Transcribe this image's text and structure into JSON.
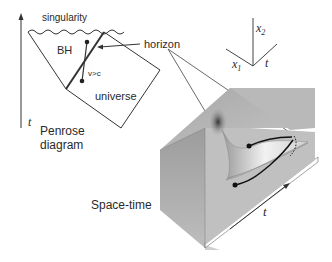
{
  "penrose": {
    "singularity": "singularity",
    "bh": "BH",
    "v_gt_c": "v>c",
    "universe": "universe",
    "t_axis": "t",
    "title_line1": "Penrose",
    "title_line2": "diagram"
  },
  "horizon_label": "horizon",
  "axes": {
    "x2": "x",
    "x2_sub": "2",
    "x1": "x",
    "x1_sub": "1",
    "t": "t"
  },
  "spacetime": {
    "title": "Space-time",
    "t_axis": "t"
  },
  "colors": {
    "line": "#2a2a2a",
    "surface": "#b4b4b4",
    "surface_dark": "#8a8a8a",
    "funnel_light": "#e6e6e6"
  }
}
